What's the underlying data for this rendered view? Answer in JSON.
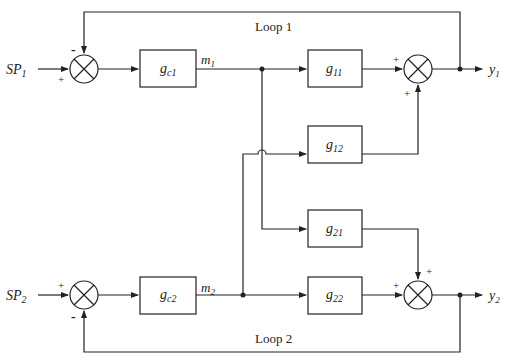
{
  "diagram": {
    "type": "block-diagram",
    "loops": [
      {
        "label": "Loop 1"
      },
      {
        "label": "Loop 2"
      }
    ],
    "inputs": [
      {
        "label": "SP",
        "sub": "1"
      },
      {
        "label": "SP",
        "sub": "2"
      }
    ],
    "outputs": [
      {
        "label": "y",
        "sub": "1"
      },
      {
        "label": "y",
        "sub": "2"
      }
    ],
    "signals": [
      {
        "label": "m",
        "sub": "1"
      },
      {
        "label": "m",
        "sub": "2"
      }
    ],
    "blocks": {
      "gc1": {
        "label": "g",
        "sub": "c1"
      },
      "gc2": {
        "label": "g",
        "sub": "c2"
      },
      "g11": {
        "label": "g",
        "sub": "11"
      },
      "g12": {
        "label": "g",
        "sub": "12"
      },
      "g21": {
        "label": "g",
        "sub": "21"
      },
      "g22": {
        "label": "g",
        "sub": "22"
      }
    },
    "signs": {
      "plus": "+",
      "minus": "-"
    }
  }
}
